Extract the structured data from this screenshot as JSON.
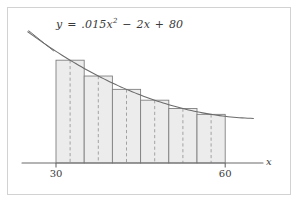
{
  "figure": {
    "caption_equation_plain": "y = .015x^2 - 2x + 80",
    "equation": {
      "lhs": "y",
      "equals": "=",
      "coef_quadratic": ".015",
      "var_quadratic": "x",
      "exponent": "2",
      "minus": "−",
      "coef_linear": "2",
      "var_linear": "x",
      "plus": "+",
      "constant": "80"
    },
    "axis": {
      "x_label": "x",
      "tick_labels": [
        "30",
        "60"
      ],
      "x_min_label": "30",
      "x_max_label": "60"
    },
    "colors": {
      "frame_border": "#d2d2d2",
      "background": "#ffffff",
      "bar_fill": "#ececec",
      "bar_stroke": "#808080",
      "curve_stroke": "#6b6b6b",
      "axis_stroke": "#6b6b6b",
      "midline_stroke": "#9a9a9a",
      "text": "#3a3a3a"
    }
  },
  "chart_data": {
    "type": "bar",
    "title": "",
    "subtitle": "",
    "xlabel": "x",
    "ylabel": "",
    "grid": false,
    "legend": "none",
    "annotations": [
      "y = .015x² − 2x + 80"
    ],
    "xlim": [
      30,
      60
    ],
    "ylim": [
      0,
      80
    ],
    "xticks": [
      30,
      60
    ],
    "xticklabels": [
      "30",
      "60"
    ],
    "function": {
      "expression": "0.015*x^2 - 2*x + 80",
      "a": 0.015,
      "b": -2,
      "c": 80,
      "domain": [
        25,
        65
      ],
      "sample_points": [
        {
          "x": 25,
          "y": 39.375
        },
        {
          "x": 30,
          "y": 33.5
        },
        {
          "x": 35,
          "y": 28.375
        },
        {
          "x": 40,
          "y": 24.0
        },
        {
          "x": 45,
          "y": 20.375
        },
        {
          "x": 50,
          "y": 17.5
        },
        {
          "x": 55,
          "y": 15.375
        },
        {
          "x": 60,
          "y": 14.0
        },
        {
          "x": 65,
          "y": 13.375
        }
      ]
    },
    "rule": "midpoint",
    "n_rectangles": 6,
    "interval_width": 5,
    "edges": [
      30,
      35,
      40,
      45,
      50,
      55,
      60
    ],
    "midpoints": [
      32.5,
      37.5,
      42.5,
      47.5,
      52.5,
      57.5
    ],
    "categories": [
      "30-35",
      "35-40",
      "40-45",
      "45-50",
      "50-55",
      "55-60"
    ],
    "values": [
      30.84375,
      26.09375,
      22.09375,
      18.84375,
      16.34375,
      14.59375
    ]
  }
}
